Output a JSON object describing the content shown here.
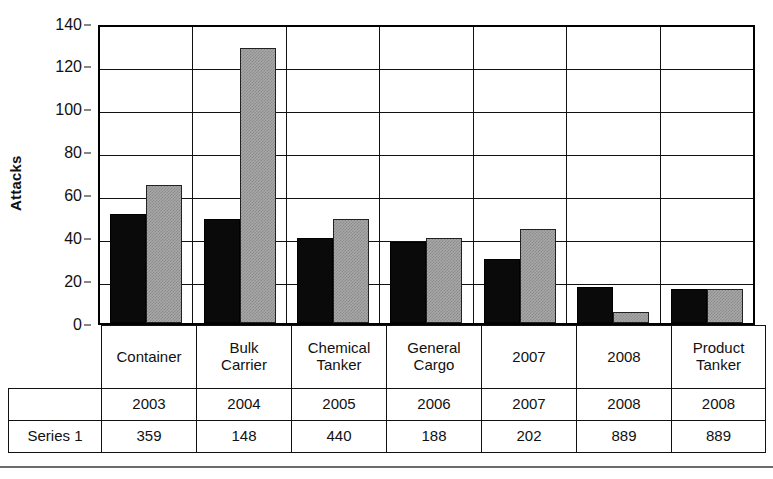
{
  "chart_data": {
    "type": "bar",
    "title": "",
    "xlabel": "",
    "ylabel": "Attacks",
    "ylim": [
      0,
      140
    ],
    "ytick_step": 20,
    "yticks": [
      0,
      20,
      40,
      60,
      80,
      100,
      120,
      140
    ],
    "grid": true,
    "legend": "none",
    "categories": [
      "Container",
      "Bulk Carrier",
      "Chemical Tanker",
      "General Cargo",
      "2007",
      "2008",
      "Product Tanker"
    ],
    "category_lines": [
      [
        "Container"
      ],
      [
        "Bulk",
        "Carrier"
      ],
      [
        "Chemical",
        "Tanker"
      ],
      [
        "General",
        "Cargo"
      ],
      [
        "2007"
      ],
      [
        "2008"
      ],
      [
        "Product",
        "Tanker"
      ]
    ],
    "series": [
      {
        "name": "dark",
        "color": "#0a0a0a",
        "values": [
          51,
          49,
          40,
          38,
          30,
          17,
          16
        ]
      },
      {
        "name": "light",
        "color": "#a8a8a8",
        "values": [
          65,
          129,
          49,
          40,
          44,
          5,
          16
        ]
      }
    ]
  },
  "axis": {
    "y_title": "Attacks",
    "y_tick_labels": [
      "140",
      "120",
      "100",
      "80",
      "60",
      "40",
      "20",
      "0"
    ]
  },
  "table": {
    "row_label_blank": "",
    "series_label": "Series 1",
    "year_row": [
      "2003",
      "2004",
      "2005",
      "2006",
      "2007",
      "2008",
      "2008"
    ],
    "series_row": [
      "359",
      "148",
      "440",
      "188",
      "202",
      "889",
      "889"
    ]
  },
  "colors": {
    "dark_bar": "#0a0a0a",
    "light_bar": "#a8a8a8",
    "axis": "#111111",
    "background": "#ffffff"
  }
}
